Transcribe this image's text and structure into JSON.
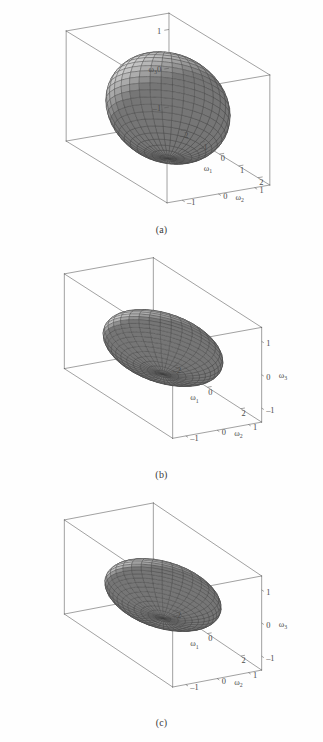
{
  "figure": {
    "background_color": "#fefefe",
    "line_color": "#555555",
    "surface_color": "#b5b5b5",
    "mesh_color": "#3c3c3c",
    "panels": [
      {
        "id": "a",
        "caption": "(a)",
        "axes": {
          "x": {
            "label": "ω",
            "sub": "1",
            "ticks": [
              "–2",
              "–1",
              "0",
              "1",
              "2"
            ],
            "values": [
              -2,
              -1,
              0,
              1,
              2
            ],
            "range": [
              -2.6,
              2.6
            ]
          },
          "y": {
            "label": "ω",
            "sub": "2",
            "ticks": [
              "1",
              "0",
              "–1"
            ],
            "values": [
              1,
              0,
              -1
            ],
            "range": [
              -1.4,
              1.4
            ]
          },
          "z": {
            "label": "ω",
            "sub": "3",
            "ticks": [
              "1",
              "0",
              "–1"
            ],
            "values": [
              1,
              0,
              -1
            ],
            "range": [
              -1.4,
              1.4
            ]
          }
        },
        "ellipsoid": {
          "a": 2.0,
          "b": 1.35,
          "c": 1.3
        },
        "z_label_side": "left"
      },
      {
        "id": "b",
        "caption": "(b)",
        "axes": {
          "x": {
            "label": "ω",
            "sub": "1",
            "ticks": [
              "–2",
              "0",
              "2"
            ],
            "values": [
              -2,
              0,
              2
            ],
            "range": [
              -3.2,
              3.2
            ]
          },
          "y": {
            "label": "ω",
            "sub": "2",
            "ticks": [
              "1",
              "0",
              "–1"
            ],
            "values": [
              1,
              0,
              -1
            ],
            "range": [
              -1.4,
              1.4
            ]
          },
          "z": {
            "label": "ω",
            "sub": "3",
            "ticks": [
              "1",
              "0",
              "–1"
            ],
            "values": [
              1,
              0,
              -1
            ],
            "range": [
              -1.4,
              1.4
            ]
          }
        },
        "ellipsoid": {
          "a": 2.55,
          "b": 1.35,
          "c": 0.78
        },
        "z_label_side": "right"
      },
      {
        "id": "c",
        "caption": "(c)",
        "axes": {
          "x": {
            "label": "ω",
            "sub": "1",
            "ticks": [
              "–2",
              "0",
              "2"
            ],
            "values": [
              -2,
              0,
              2
            ],
            "range": [
              -3.2,
              3.2
            ]
          },
          "y": {
            "label": "ω",
            "sub": "2",
            "ticks": [
              "1",
              "0",
              "–1"
            ],
            "values": [
              1,
              0,
              -1
            ],
            "range": [
              -1.4,
              1.4
            ]
          },
          "z": {
            "label": "ω",
            "sub": "3",
            "ticks": [
              "1",
              "0",
              "–1"
            ],
            "values": [
              1,
              0,
              -1
            ],
            "range": [
              -1.4,
              1.4
            ]
          }
        },
        "ellipsoid": {
          "a": 2.4,
          "b": 1.35,
          "c": 0.7
        },
        "z_label_side": "right"
      }
    ]
  },
  "chart_data": {
    "type": "scatter",
    "title": "",
    "xlabel": "ω₁",
    "ylabel": "ω₂",
    "zlabel": "ω₃",
    "plots": [
      {
        "name": "(a)",
        "surface": "ellipsoid",
        "semi_axes": {
          "omega1": 2.0,
          "omega2": 1.35,
          "omega3": 1.3
        },
        "xlim": [
          -2.6,
          2.6
        ],
        "ylim": [
          -1.4,
          1.4
        ],
        "zlim": [
          -1.4,
          1.4
        ],
        "xticks": [
          -2,
          -1,
          0,
          1,
          2
        ],
        "yticks": [
          1,
          0,
          -1
        ],
        "zticks": [
          1,
          0,
          -1
        ],
        "grid": false,
        "mesh": {
          "meridians": 32,
          "parallels": 22
        }
      },
      {
        "name": "(b)",
        "surface": "ellipsoid",
        "semi_axes": {
          "omega1": 2.55,
          "omega2": 1.35,
          "omega3": 0.78
        },
        "xlim": [
          -3.2,
          3.2
        ],
        "ylim": [
          -1.4,
          1.4
        ],
        "zlim": [
          -1.4,
          1.4
        ],
        "xticks": [
          -2,
          0,
          2
        ],
        "yticks": [
          1,
          0,
          -1
        ],
        "zticks": [
          1,
          0,
          -1
        ],
        "grid": false,
        "mesh": {
          "meridians": 32,
          "parallels": 22
        }
      },
      {
        "name": "(c)",
        "surface": "ellipsoid",
        "semi_axes": {
          "omega1": 2.4,
          "omega2": 1.35,
          "omega3": 0.7
        },
        "xlim": [
          -3.2,
          3.2
        ],
        "ylim": [
          -1.4,
          1.4
        ],
        "zlim": [
          -1.4,
          1.4
        ],
        "xticks": [
          -2,
          0,
          2
        ],
        "yticks": [
          1,
          0,
          -1
        ],
        "zticks": [
          1,
          0,
          -1
        ],
        "grid": false,
        "mesh": {
          "meridians": 32,
          "parallels": 22
        }
      }
    ],
    "legend": [],
    "annotations": [
      "(a)",
      "(b)",
      "(c)"
    ]
  }
}
